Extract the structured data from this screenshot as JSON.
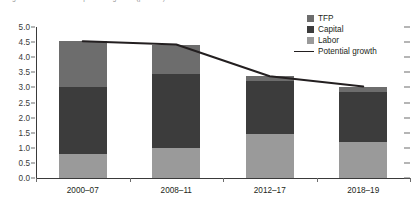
{
  "title": "Figure: Contributions to potential growth (percent)",
  "legend": {
    "position": "top-right",
    "items": [
      {
        "label": "TFP",
        "marker": "square",
        "color": "#6d6d6d"
      },
      {
        "label": "Capital",
        "marker": "square",
        "color": "#3c3c3c"
      },
      {
        "label": "Labor",
        "marker": "square",
        "color": "#9a9a9a"
      },
      {
        "label": "Potential growth",
        "marker": "line",
        "color": "#231f20"
      }
    ]
  },
  "axis": {
    "y_ticks": [
      "5.0",
      "4.5",
      "4.0",
      "3.5",
      "3.0",
      "2.5",
      "2.0",
      "1.5",
      "1.0",
      "0.5",
      "0.0"
    ],
    "x_ticks": [
      "2000–07",
      "2008–11",
      "2012–17",
      "2018–19"
    ]
  },
  "chart_data": {
    "type": "bar",
    "stacked": true,
    "title": "",
    "xlabel": "",
    "ylabel": "",
    "ylim": [
      0,
      5
    ],
    "ytick_step": 0.5,
    "grid": false,
    "legend_position": "top-right",
    "categories": [
      "2000–07",
      "2008–11",
      "2012–17",
      "2018–19"
    ],
    "series": [
      {
        "name": "Labor",
        "color": "#9a9a9a",
        "values": [
          0.78,
          1.0,
          1.45,
          1.18
        ]
      },
      {
        "name": "Capital",
        "color": "#3c3c3c",
        "values": [
          2.22,
          2.45,
          1.75,
          1.67
        ]
      },
      {
        "name": "TFP",
        "color": "#6d6d6d",
        "values": [
          1.53,
          0.97,
          0.17,
          0.18
        ]
      }
    ],
    "overlay": {
      "name": "Potential growth",
      "type": "line",
      "color": "#231f20",
      "values": [
        4.53,
        4.42,
        3.37,
        3.03
      ]
    },
    "bar_totals": [
      4.53,
      4.42,
      3.37,
      3.03
    ]
  }
}
